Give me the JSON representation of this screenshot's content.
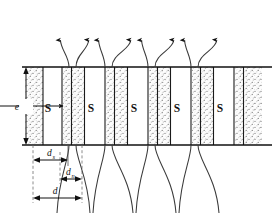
{
  "figure": {
    "type": "technical-cross-section-diagram",
    "background_color": "#ffffff",
    "line_color": "#1a1a1a",
    "stipple_color": "#5a5a5a",
    "band_fill": "#fbfbfb"
  },
  "geometry": {
    "channel_top_y": 67,
    "channel_bottom_y": 145,
    "channel_left_x": 22,
    "channel_right_x": 272
  },
  "labels": {
    "solid_zone": "S",
    "solid_zone_count": 5,
    "height_symbol": "e",
    "d_s_base": "d",
    "d_s_sub": "s",
    "d_n_base": "d",
    "d_n_sub": "n",
    "d_total": "d"
  },
  "solid_zones": [
    {
      "label": "S",
      "x": 48,
      "y": 108
    },
    {
      "label": "S",
      "x": 91,
      "y": 108
    },
    {
      "label": "S",
      "x": 134,
      "y": 108
    },
    {
      "label": "S",
      "x": 177,
      "y": 108
    },
    {
      "label": "S",
      "x": 220,
      "y": 108
    }
  ],
  "porous_bands": [
    {
      "x": 25,
      "width": 18
    },
    {
      "x": 63,
      "width": 8
    },
    {
      "x": 72,
      "width": 12
    },
    {
      "x": 106,
      "width": 8
    },
    {
      "x": 115,
      "width": 12
    },
    {
      "x": 149,
      "width": 8
    },
    {
      "x": 158,
      "width": 12
    },
    {
      "x": 192,
      "width": 8
    },
    {
      "x": 201,
      "width": 12
    },
    {
      "x": 235,
      "width": 8
    },
    {
      "x": 244,
      "width": 18
    }
  ],
  "streamlines": [
    {
      "x_bottom": 69,
      "x_top": 60
    },
    {
      "x_bottom": 76,
      "x_top": 89
    },
    {
      "x_bottom": 105,
      "x_top": 99
    },
    {
      "x_bottom": 112,
      "x_top": 131
    },
    {
      "x_bottom": 148,
      "x_top": 142
    },
    {
      "x_bottom": 155,
      "x_top": 174
    },
    {
      "x_bottom": 191,
      "x_top": 185
    },
    {
      "x_bottom": 198,
      "x_top": 217
    }
  ],
  "arrow_count": 8,
  "dimensions": {
    "e": {
      "orientation": "vertical",
      "from_y": 67,
      "to_y": 145,
      "x": 26
    },
    "d_s": {
      "orientation": "horizontal",
      "from_x": 33,
      "to_x": 68,
      "y": 158
    },
    "d_n": {
      "orientation": "horizontal",
      "from_x": 60,
      "to_x": 82,
      "y": 177
    },
    "d": {
      "orientation": "horizontal",
      "from_x": 33,
      "to_x": 82,
      "y": 196
    }
  }
}
